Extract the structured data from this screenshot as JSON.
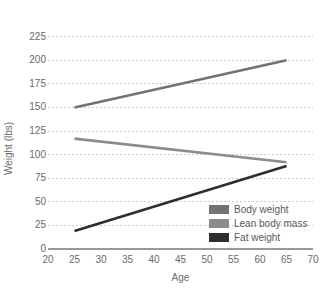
{
  "chart_data": {
    "type": "line",
    "title": "",
    "subtitle": "",
    "xlabel": "Age",
    "ylabel": "Weight (lbs)",
    "xlim": [
      20,
      70
    ],
    "ylim": [
      0,
      231
    ],
    "xticks": [
      20,
      25,
      30,
      35,
      40,
      45,
      50,
      55,
      60,
      65,
      70
    ],
    "yticks": [
      0,
      25,
      50,
      75,
      100,
      125,
      150,
      175,
      200,
      225
    ],
    "xtick_labels": [
      "20",
      "25",
      "30",
      "35",
      "40",
      "45",
      "50",
      "55",
      "60",
      "65",
      "70"
    ],
    "ytick_labels": [
      "0",
      "25",
      "50",
      "75",
      "100",
      "125",
      "150",
      "175",
      "200",
      "225"
    ],
    "grid": "horizontal-dashed",
    "grid_color": "#cccccc",
    "axis_color": "#999999",
    "background": "#ffffff",
    "legend_position": "bottom-right",
    "x": [
      25,
      65
    ],
    "series": [
      {
        "name": "Body weight",
        "values": [
          150,
          200
        ],
        "color": "#737373"
      },
      {
        "name": "Lean body mass",
        "values": [
          117,
          92
        ],
        "color": "#8c8c8c"
      },
      {
        "name": "Fat weight",
        "values": [
          19,
          88
        ],
        "color": "#2e2e2e"
      }
    ]
  },
  "legend": {
    "items": [
      {
        "label": "Body weight",
        "color": "#737373"
      },
      {
        "label": "Lean body mass",
        "color": "#8c8c8c"
      },
      {
        "label": "Fat weight",
        "color": "#2e2e2e"
      }
    ]
  }
}
